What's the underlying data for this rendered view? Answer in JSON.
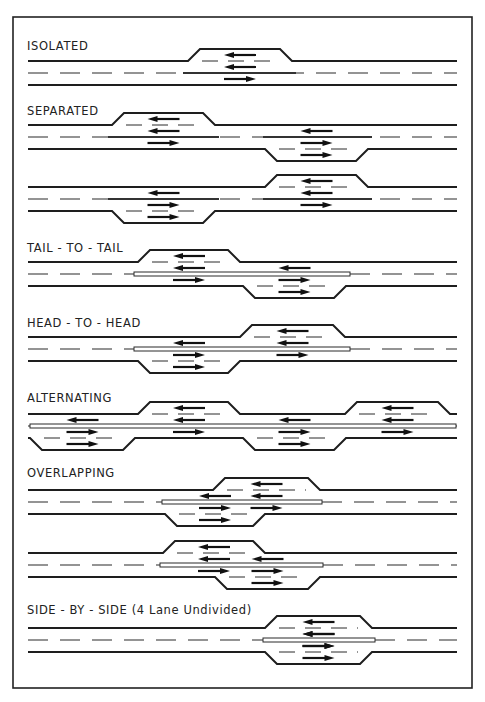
{
  "figure": {
    "sections": [
      {
        "id": "isolated",
        "title": "ISOLATED"
      },
      {
        "id": "separated",
        "title": "SEPARATED"
      },
      {
        "id": "tail-to-tail",
        "title": "TAIL - TO - TAIL"
      },
      {
        "id": "head-to-head",
        "title": "HEAD - TO - HEAD"
      },
      {
        "id": "alternating",
        "title": "ALTERNATING"
      },
      {
        "id": "overlapping",
        "title": "OVERLAPPING"
      },
      {
        "id": "side-by-side",
        "title": "SIDE - BY - SIDE (4 Lane Undivided)"
      }
    ],
    "diagrams": [
      {
        "section": "isolated",
        "passing_lanes": [
          {
            "side": "top",
            "direction": "left"
          }
        ]
      },
      {
        "section": "separated",
        "passing_lanes": [
          {
            "side": "top",
            "direction": "left"
          },
          {
            "side": "bottom",
            "direction": "right"
          }
        ]
      },
      {
        "section": "separated",
        "passing_lanes": [
          {
            "side": "bottom",
            "direction": "right"
          },
          {
            "side": "top",
            "direction": "left"
          }
        ]
      },
      {
        "section": "tail-to-tail",
        "passing_lanes": [
          {
            "side": "top",
            "direction": "left"
          },
          {
            "side": "bottom",
            "direction": "right"
          }
        ]
      },
      {
        "section": "head-to-head",
        "passing_lanes": [
          {
            "side": "bottom",
            "direction": "right"
          },
          {
            "side": "top",
            "direction": "left"
          }
        ]
      },
      {
        "section": "alternating",
        "passing_lanes": [
          {
            "side": "bottom",
            "direction": "right"
          },
          {
            "side": "top",
            "direction": "left"
          },
          {
            "side": "bottom",
            "direction": "right"
          },
          {
            "side": "top",
            "direction": "left"
          }
        ]
      },
      {
        "section": "overlapping",
        "passing_lanes": [
          {
            "side": "top",
            "direction": "left"
          },
          {
            "side": "bottom",
            "direction": "right"
          }
        ]
      },
      {
        "section": "overlapping",
        "passing_lanes": [
          {
            "side": "top",
            "direction": "left"
          },
          {
            "side": "bottom",
            "direction": "right"
          }
        ]
      },
      {
        "section": "side-by-side",
        "passing_lanes": [
          {
            "side": "top",
            "direction": "left"
          },
          {
            "side": "bottom",
            "direction": "right"
          }
        ]
      }
    ]
  }
}
